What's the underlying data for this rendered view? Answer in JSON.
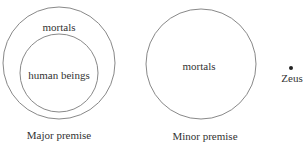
{
  "diagram": {
    "major_premise": {
      "caption": "Major premise",
      "outer_label": "mortals",
      "inner_label": "human beings"
    },
    "minor_premise": {
      "caption": "Minor premise",
      "circle_label": "mortals",
      "point_label": "Zeus"
    },
    "colors": {
      "stroke": "#7a7a7a",
      "text": "#333333",
      "dot": "#222222"
    }
  }
}
